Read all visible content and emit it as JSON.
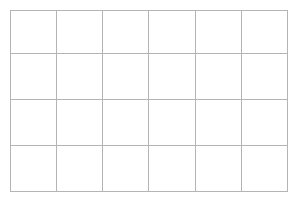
{
  "figure": {
    "kind": "empty-grid",
    "background_color": "#ffffff",
    "line_color": "#b4b4b4",
    "line_width_px": 1
  },
  "grid": {
    "columns": 6,
    "rows": 4,
    "column_labels": [
      "",
      "",
      "",
      "",
      "",
      ""
    ],
    "row_labels": [
      "",
      "",
      "",
      ""
    ],
    "cells": [
      [
        "",
        "",
        "",
        "",
        "",
        ""
      ],
      [
        "",
        "",
        "",
        "",
        "",
        ""
      ],
      [
        "",
        "",
        "",
        "",
        "",
        ""
      ],
      [
        "",
        "",
        "",
        "",
        "",
        ""
      ]
    ]
  }
}
